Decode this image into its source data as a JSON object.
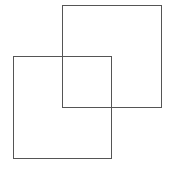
{
  "diagram": {
    "background": "#ffffff",
    "stroke_color": "#555555",
    "shapes": [
      {
        "name": "square-top-right",
        "type": "square-outline",
        "x": 62,
        "y": 5,
        "width": 100,
        "height": 103
      },
      {
        "name": "square-bottom-left",
        "type": "square-outline",
        "x": 13,
        "y": 56,
        "width": 99,
        "height": 103
      }
    ]
  }
}
